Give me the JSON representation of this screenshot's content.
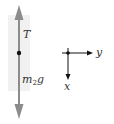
{
  "diagram": {
    "type": "free-body diagram",
    "forces": [
      {
        "label": "T",
        "direction": "up",
        "color": "#8a8a8a"
      },
      {
        "label": "m",
        "subscript": "2",
        "suffix": "g",
        "direction": "down",
        "color": "#8a8a8a"
      }
    ],
    "body_point_color": "#111111",
    "panel_color": "#f0f0f0",
    "axes": {
      "x_label": "x",
      "x_direction": "down",
      "y_label": "y",
      "y_direction": "right",
      "color": "#111111"
    }
  }
}
